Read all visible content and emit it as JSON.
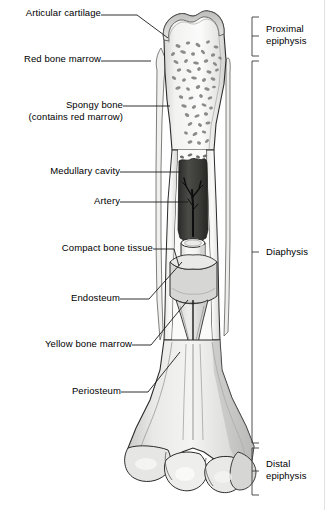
{
  "figure": {
    "type": "anatomical-diagram"
  },
  "callouts": [
    {
      "id": "articular-cartilage",
      "label": "Articular cartilage",
      "text_x": 96,
      "text_y": 12,
      "line_x1": 101,
      "line_y1": 15,
      "line_x2": 137,
      "line_y2": 15,
      "line_x3": 168,
      "line_y3": 38
    },
    {
      "id": "red-bone-marrow",
      "label": "Red bone marrow",
      "text_x": 96,
      "text_y": 58,
      "line_x1": 101,
      "line_y1": 61,
      "line_x2": 151,
      "line_y2": 61,
      "line_x3": 151,
      "line_y3": 61
    },
    {
      "id": "spongy-bone",
      "label": "Spongy bone",
      "label2": "(contains red marrow)",
      "text_x": 118,
      "text_y": 100,
      "line_x1": 123,
      "line_y1": 106,
      "line_x2": 170,
      "line_y2": 106,
      "line_x3": 170,
      "line_y3": 106
    },
    {
      "id": "medullary-cavity",
      "label": "Medullary cavity",
      "text_x": 115,
      "text_y": 168,
      "line_x1": 120,
      "line_y1": 172,
      "line_x2": 180,
      "line_y2": 172,
      "line_x3": 180,
      "line_y3": 172
    },
    {
      "id": "artery",
      "label": "Artery",
      "text_x": 115,
      "text_y": 198,
      "line_x1": 120,
      "line_y1": 202,
      "line_x2": 186,
      "line_y2": 202,
      "line_x3": 186,
      "line_y3": 202
    },
    {
      "id": "compact-bone-tissue",
      "label": "Compact bone tissue",
      "text_x": 148,
      "text_y": 245,
      "line_x1": 153,
      "line_y1": 249,
      "line_x2": 174,
      "line_y2": 249,
      "line_x3": 177,
      "line_y3": 262
    },
    {
      "id": "endosteum",
      "label": "Endosteum",
      "text_x": 115,
      "text_y": 295,
      "line_x1": 120,
      "line_y1": 299,
      "line_x2": 149,
      "line_y2": 299,
      "line_x3": 181,
      "line_y3": 262
    },
    {
      "id": "yellow-bone-marrow",
      "label": "Yellow bone marrow",
      "text_x": 127,
      "text_y": 341,
      "line_x1": 132,
      "line_y1": 345,
      "line_x2": 151,
      "line_y2": 345,
      "line_x3": 186,
      "line_y3": 300
    },
    {
      "id": "periosteum",
      "label": "Periosteum",
      "text_x": 116,
      "text_y": 388,
      "line_x1": 121,
      "line_y1": 392,
      "line_x2": 148,
      "line_y2": 392,
      "line_x3": 178,
      "line_y3": 352
    }
  ],
  "regions": [
    {
      "id": "proximal-epiphysis",
      "label": "Proximal",
      "label2": "epiphysis",
      "bracket_top": 17,
      "bracket_bottom": 56,
      "text_x": 270,
      "text_y": 24
    },
    {
      "id": "diaphysis",
      "label": "Diaphysis",
      "label2": "",
      "bracket_top": 61,
      "bracket_bottom": 443,
      "text_x": 270,
      "text_y": 246
    },
    {
      "id": "distal-epiphysis",
      "label": "Distal",
      "label2": "epiphysis",
      "bracket_top": 448,
      "bracket_bottom": 495,
      "text_x": 270,
      "text_y": 455
    }
  ],
  "bracket": {
    "x": 252,
    "tick_length": 7,
    "color": "#3a3a3a"
  },
  "colors": {
    "outline": "#2b2b2b",
    "bone_light": "#f4f4f3",
    "bone_mid": "#dededc",
    "bone_shade": "#c6c6c4",
    "bone_dark_shade": "#a9a9a7",
    "cartilage": "#cfcfcd",
    "marrow_cavity": "#3a3a38",
    "artery": "#151515",
    "trabecula": "#8e8e8c",
    "leader_line": "#1a1a1a",
    "background": "#ffffff"
  }
}
